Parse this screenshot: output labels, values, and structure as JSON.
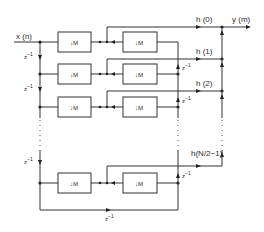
{
  "diagram": {
    "input_label": "x (n)",
    "output_label": "y (m)",
    "decimator_label": "M",
    "delay_label": "z",
    "delay_exp": "−1",
    "tap_labels": [
      "h (0)",
      "h (1)",
      "h (2)",
      "h(N/2−1)"
    ],
    "rows": 4,
    "boxes_per_row": 2,
    "line_color": "#333333"
  }
}
